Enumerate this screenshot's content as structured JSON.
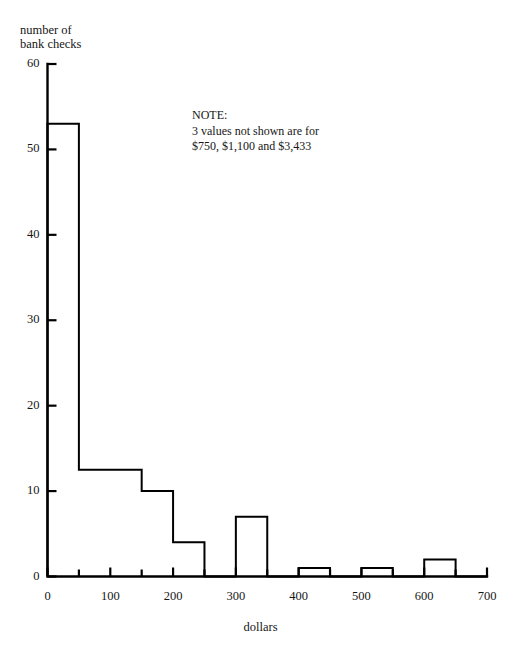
{
  "chart_data": {
    "type": "bar",
    "title": "",
    "subtitle": "",
    "xlabel": "dollars",
    "ylabel_line1": "number of",
    "ylabel_line2": "bank checks",
    "ylabel": "number of bank checks",
    "xlim": [
      0,
      700
    ],
    "ylim": [
      0,
      60
    ],
    "bin_width": 50,
    "grid": false,
    "legend": null,
    "x_major_ticks": [
      0,
      100,
      200,
      300,
      400,
      500,
      600,
      700
    ],
    "x_minor_ticks": [
      50,
      150,
      250,
      350,
      450,
      550,
      650
    ],
    "x_tick_labels": [
      "0",
      "100",
      "200",
      "300",
      "400",
      "500",
      "600",
      "700"
    ],
    "y_major_ticks": [
      0,
      10,
      20,
      30,
      40,
      50,
      60
    ],
    "y_tick_labels": [
      "0",
      "10",
      "20",
      "30",
      "40",
      "50",
      "60"
    ],
    "bins": [
      {
        "start": 0,
        "end": 50,
        "value": 53
      },
      {
        "start": 50,
        "end": 100,
        "value": 12.5
      },
      {
        "start": 100,
        "end": 150,
        "value": 12.5
      },
      {
        "start": 150,
        "end": 200,
        "value": 10
      },
      {
        "start": 200,
        "end": 250,
        "value": 4
      },
      {
        "start": 250,
        "end": 300,
        "value": 0
      },
      {
        "start": 300,
        "end": 350,
        "value": 7
      },
      {
        "start": 350,
        "end": 400,
        "value": 0
      },
      {
        "start": 400,
        "end": 450,
        "value": 1
      },
      {
        "start": 450,
        "end": 500,
        "value": 0
      },
      {
        "start": 500,
        "end": 550,
        "value": 1
      },
      {
        "start": 550,
        "end": 600,
        "value": 0
      },
      {
        "start": 600,
        "end": 650,
        "value": 2
      },
      {
        "start": 650,
        "end": 700,
        "value": 0
      }
    ],
    "categories": [
      "0-50",
      "50-100",
      "100-150",
      "150-200",
      "200-250",
      "250-300",
      "300-350",
      "350-400",
      "400-450",
      "450-500",
      "500-550",
      "550-600",
      "600-650",
      "650-700"
    ],
    "values": [
      53,
      12.5,
      12.5,
      10,
      4,
      0,
      7,
      0,
      1,
      0,
      1,
      0,
      2,
      0
    ],
    "annotations": {
      "note_heading": "NOTE:",
      "note_line1": "3 values not shown are for",
      "note_line2": "$750, $1,100 and $3,433"
    },
    "colors": {
      "ink": "#000000",
      "background": "#ffffff",
      "text": "#161616"
    }
  }
}
